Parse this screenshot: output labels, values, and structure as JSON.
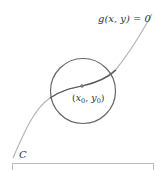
{
  "diagram": {
    "curve_label": "g(x, y) = 0",
    "point_label_x": "x",
    "point_label_x_sub": "0",
    "point_label_y": "y",
    "point_label_y_sub": "0",
    "curve_name": "C",
    "colors": {
      "curve_outer": "#b0b0b0",
      "curve_inner": "#555555",
      "circle": "#666666",
      "point": "#777777",
      "box": "#bbbbbb"
    }
  }
}
